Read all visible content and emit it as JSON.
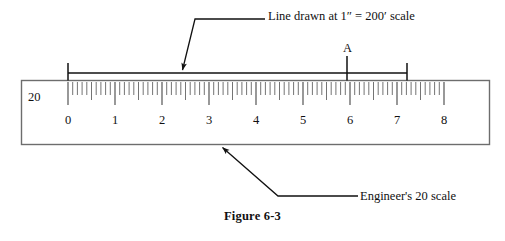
{
  "figure": {
    "caption": "Figure 6-3",
    "top_note": "Line drawn at 1″ = 200′ scale",
    "bottom_note": "Engineer's 20 scale",
    "point_label": "A",
    "scale_name": "20"
  },
  "colors": {
    "ink": "#111111",
    "rule_line": "#6d6d6d",
    "tick": "#6d6d6d",
    "background": "#ffffff"
  },
  "chart_data": {
    "type": "scale-diagram",
    "title": "Figure 6-3",
    "ruler": {
      "scale_designation": "20",
      "axis_min": 0,
      "axis_max": 8,
      "tick_labels": [
        "0",
        "1",
        "2",
        "3",
        "4",
        "5",
        "6",
        "7",
        "8"
      ],
      "minor_ticks_per_unit": 10,
      "half_tick_at": 5
    },
    "measurement": {
      "bracket_start_value": 0.0,
      "bracket_end_value": 7.2,
      "point_marker_label": "A",
      "point_marker_value": 5.95,
      "stated_scale": "1″ = 200′"
    },
    "annotations": [
      {
        "text": "Line drawn at 1″ = 200′ scale",
        "points_to": "measurement-bracket"
      },
      {
        "text": "Engineer's 20 scale",
        "points_to": "ruler-body"
      }
    ]
  },
  "geometry": {
    "ruler_box": {
      "x": 21,
      "y": 80,
      "width": 469,
      "height": 65
    },
    "origin_x": 68,
    "unit_px": 47,
    "tick_top_y": 82,
    "major_tick_bottom_y": 105,
    "minor_tick_bottom_y": 95,
    "half_tick_bottom_y": 100,
    "number_row_y": 113,
    "bracket_y": 73,
    "bracket_x1": 68,
    "bracket_x2": 407,
    "bracket_cap_top": 63,
    "bracket_cap_bottom": 80,
    "marker_a_x": 347,
    "marker_a_top": 56,
    "marker_a_bottom": 80,
    "leader_top": [
      [
        265,
        19
      ],
      [
        195,
        19
      ],
      [
        181,
        71
      ]
    ],
    "leader_bottom": [
      [
        358,
        196
      ],
      [
        278,
        196
      ],
      [
        221,
        147
      ]
    ]
  }
}
